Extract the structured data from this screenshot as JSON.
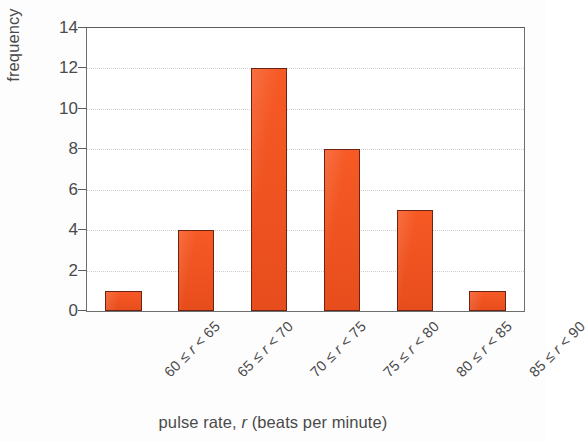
{
  "chart_data": {
    "type": "bar",
    "title": "",
    "subtitle": "",
    "xlabel": "pulse rate, r (beats per minute)",
    "ylabel": "frequency",
    "categories": [
      "60 ≤ r < 65",
      "65 ≤ r < 70",
      "70 ≤ r < 75",
      "75 ≤ r < 80",
      "80 ≤ r < 85",
      "85 ≤ r < 90"
    ],
    "category_parts": [
      {
        "low": "60",
        "rel1": "≤",
        "var": "r",
        "rel2": "<",
        "high": "65"
      },
      {
        "low": "65",
        "rel1": "≤",
        "var": "r",
        "rel2": "<",
        "high": "70"
      },
      {
        "low": "70",
        "rel1": "≤",
        "var": "r",
        "rel2": "<",
        "high": "75"
      },
      {
        "low": "75",
        "rel1": "≤",
        "var": "r",
        "rel2": "<",
        "high": "80"
      },
      {
        "low": "80",
        "rel1": "≤",
        "var": "r",
        "rel2": "<",
        "high": "85"
      },
      {
        "low": "85",
        "rel1": "≤",
        "var": "r",
        "rel2": "<",
        "high": "90"
      }
    ],
    "values": [
      1,
      4,
      12,
      8,
      5,
      1
    ],
    "ylim": [
      0,
      14
    ],
    "yticks": [
      0,
      2,
      4,
      6,
      8,
      10,
      12,
      14
    ],
    "ytick_labels": [
      "0",
      "2",
      "4",
      "6",
      "8",
      "10",
      "12",
      "14"
    ],
    "grid": true,
    "grid_axis": "y",
    "legend": false,
    "xlabel_rotation": -45,
    "colors": {
      "bar_fill": "#f4511e",
      "bar_edge": "#6b2414",
      "gridline": "#cfcfcf",
      "frame": "#6e6e6e",
      "text": "#4a4a4a",
      "background": "#ffffff"
    }
  }
}
